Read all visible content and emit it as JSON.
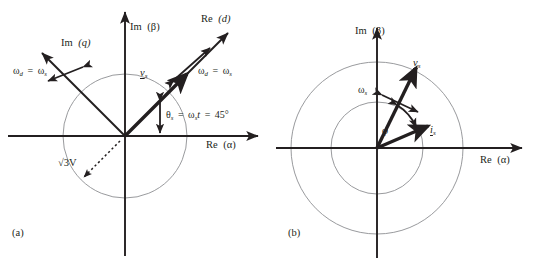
{
  "figure": {
    "background": "#ffffff",
    "ink": "#231f20",
    "circle_color": "#8d8f92",
    "width": 552,
    "height": 263
  },
  "panels": [
    {
      "id": "a",
      "caption": "(a)",
      "origin": {
        "x": 125,
        "y": 136
      },
      "circle": {
        "radius": 62,
        "label": "√3V",
        "label_note": "dotted radius line to lower-left"
      },
      "axes": [
        {
          "name": "real-stationary",
          "label_prefix": "Re",
          "label_arg": "(α)",
          "angle_deg": 0
        },
        {
          "name": "imag-stationary",
          "label_prefix": "Im",
          "label_arg": "(β)",
          "angle_deg": 90
        },
        {
          "name": "real-rotating-d",
          "label_prefix": "Re",
          "label_arg": "(d)",
          "angle_deg": 45
        },
        {
          "name": "imag-rotating-q",
          "label_prefix": "Im",
          "label_arg": "(q)",
          "angle_deg": 135
        }
      ],
      "speed_labels": [
        {
          "text": "ωd = ωs",
          "omega": "ω",
          "sub_left": "d",
          "sub_right": "s",
          "position": "left"
        },
        {
          "text": "ωd = ωs",
          "omega": "ω",
          "sub_left": "d",
          "sub_right": "s",
          "position": "right"
        }
      ],
      "vectors": [
        {
          "name": "voltage-vector",
          "symbol": "v",
          "subscript": "s",
          "underlined": true,
          "angle_deg": 45,
          "style": "bold-arrow"
        }
      ],
      "annotations": [
        {
          "name": "angle-annotation",
          "text": "θs = ωs t = 45°",
          "theta": "θ",
          "sub1": "s",
          "omega": "ω",
          "sub2": "s",
          "t": "t",
          "value": "45°"
        },
        {
          "name": "magnitude-annotation",
          "text": "√3V"
        }
      ]
    },
    {
      "id": "b",
      "caption": "(b)",
      "origin": {
        "x": 101,
        "y": 148
      },
      "circles": [
        {
          "name": "inner-circle",
          "radius": 46
        },
        {
          "name": "outer-circle",
          "radius": 86
        }
      ],
      "axes": [
        {
          "name": "real-stationary",
          "label_prefix": "Re",
          "label_arg": "(α)",
          "angle_deg": 0
        },
        {
          "name": "imag-stationary",
          "label_prefix": "Im",
          "label_arg": "(β)",
          "angle_deg": 90
        }
      ],
      "speed_labels": [
        {
          "text": "ωs",
          "omega": "ω",
          "sub": "s",
          "position": "on-voltage-vector"
        }
      ],
      "vectors": [
        {
          "name": "voltage-vector",
          "symbol": "v",
          "subscript": "s",
          "underlined": true,
          "angle_deg": 68,
          "style": "bold-arrow"
        },
        {
          "name": "current-vector",
          "symbol": "i",
          "subscript": "s",
          "underlined": true,
          "angle_deg": 22,
          "style": "bold-arrow"
        }
      ],
      "annotations": [
        {
          "name": "phase-angle",
          "text": "φ",
          "between": [
            "voltage-vector",
            "current-vector"
          ]
        }
      ]
    }
  ]
}
